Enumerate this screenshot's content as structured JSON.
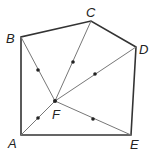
{
  "diagram": {
    "points": {
      "A": {
        "label": "A",
        "x": 21,
        "y": 135
      },
      "B": {
        "label": "B",
        "x": 21,
        "y": 37
      },
      "C": {
        "label": "C",
        "x": 91,
        "y": 21
      },
      "D": {
        "label": "D",
        "x": 136,
        "y": 47
      },
      "E": {
        "label": "E",
        "x": 131,
        "y": 135
      },
      "F": {
        "label": "F",
        "x": 55,
        "y": 101
      }
    },
    "polygon": [
      "A",
      "B",
      "C",
      "D",
      "E"
    ],
    "segments_from_F": [
      "A",
      "B",
      "C",
      "D",
      "E"
    ],
    "midpoint_dots": [
      {
        "x": 38,
        "y": 70
      },
      {
        "x": 73,
        "y": 62
      },
      {
        "x": 95,
        "y": 74
      },
      {
        "x": 38,
        "y": 118
      },
      {
        "x": 93,
        "y": 119
      }
    ],
    "colors": {
      "outline": "#333333",
      "inner": "#777777",
      "dot": "#222222"
    }
  }
}
